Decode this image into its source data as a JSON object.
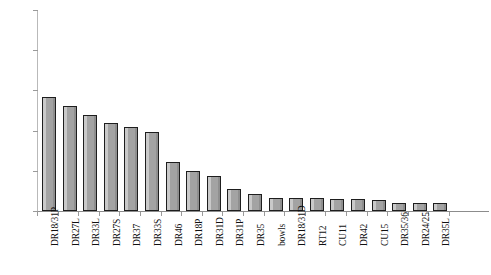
{
  "chart_data": {
    "type": "bar",
    "title": "",
    "subtitle": "",
    "xlabel": "",
    "ylabel": "",
    "grid": false,
    "legend": "none",
    "ylim": [
      0,
      25
    ],
    "ytick_values": [
      0,
      5,
      10,
      15,
      20,
      25
    ],
    "ytick_labels": [
      "0%",
      "5%",
      "10%",
      "15%",
      "20%",
      "25%"
    ],
    "value_suffix": "%",
    "categories": [
      "DR18/31P",
      "DR27L",
      "DR33L",
      "DR27S",
      "DR37",
      "DR33S",
      "DR46",
      "DR18P",
      "DR31D",
      "DR31P",
      "DR35",
      "bowls",
      "DR18/31D",
      "RT12",
      "CU11",
      "DR42",
      "CU15",
      "DR35/36",
      "DR24/25",
      "DR35L"
    ],
    "values": [
      14.2,
      13.0,
      12.0,
      10.9,
      10.4,
      9.8,
      6.1,
      5.0,
      4.4,
      2.8,
      2.1,
      1.6,
      1.6,
      1.6,
      1.5,
      1.5,
      1.4,
      1.0,
      1.0,
      1.0
    ],
    "series_name": "",
    "bar_fill_color": "#a3a3a3",
    "bar_edge_color": "#1e1e1e",
    "axis_color": "#9a9a9a",
    "background_color": "#ffffff"
  }
}
